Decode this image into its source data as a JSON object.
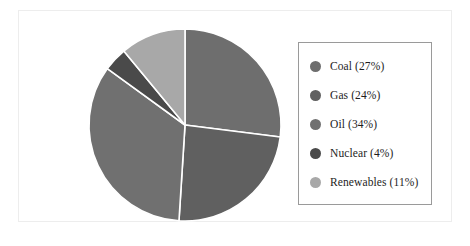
{
  "figure": {
    "background_color": "#ffffff",
    "frame_color": "#ededed",
    "legend_border_color": "#9a9a9a",
    "separator_color": "#ffffff"
  },
  "chart_data": {
    "type": "pie",
    "title": "",
    "subtitle": "",
    "xlabel": "",
    "ylabel": "",
    "grid": false,
    "legend_position": "right",
    "start_angle_deg": 90,
    "direction": "clockwise",
    "center": {
      "x": 185,
      "y": 125
    },
    "radius": 100,
    "total_percent": 100,
    "categories": [
      "Coal",
      "Gas",
      "Oil",
      "Nuclear",
      "Renewables"
    ],
    "values": [
      27,
      24,
      34,
      4,
      11
    ],
    "value_unit": "%",
    "colors": [
      "#6e6e6e",
      "#606060",
      "#707070",
      "#4a4a4a",
      "#a8a8a8"
    ],
    "slices": [
      {
        "label": "Coal",
        "value": 27,
        "color": "#6e6e6e",
        "legend_text": "Coal (27%)"
      },
      {
        "label": "Gas",
        "value": 24,
        "color": "#606060",
        "legend_text": "Gas (24%)"
      },
      {
        "label": "Oil",
        "value": 34,
        "color": "#707070",
        "legend_text": "Oil (34%)"
      },
      {
        "label": "Nuclear",
        "value": 4,
        "color": "#4a4a4a",
        "legend_text": "Nuclear (4%)"
      },
      {
        "label": "Renewables",
        "value": 11,
        "color": "#a8a8a8",
        "legend_text": "Renewables (11%)"
      }
    ]
  },
  "legend": {
    "items": [
      {
        "label": "Coal (27%)",
        "color": "#6e6e6e"
      },
      {
        "label": "Gas (24%)",
        "color": "#606060"
      },
      {
        "label": "Oil (34%)",
        "color": "#707070"
      },
      {
        "label": "Nuclear (4%)",
        "color": "#4a4a4a"
      },
      {
        "label": "Renewables (11%)",
        "color": "#a8a8a8"
      }
    ]
  }
}
